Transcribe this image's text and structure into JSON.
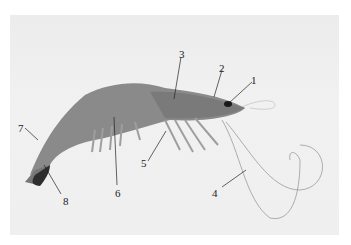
{
  "figure": {
    "labels": [
      {
        "id": "1",
        "x": 251,
        "y": 75
      },
      {
        "id": "2",
        "x": 219,
        "y": 63
      },
      {
        "id": "3",
        "x": 179,
        "y": 49
      },
      {
        "id": "4",
        "x": 212,
        "y": 188
      },
      {
        "id": "5",
        "x": 141,
        "y": 158
      },
      {
        "id": "6",
        "x": 115,
        "y": 188
      },
      {
        "id": "7",
        "x": 18,
        "y": 123
      },
      {
        "id": "8",
        "x": 63,
        "y": 196
      }
    ]
  }
}
